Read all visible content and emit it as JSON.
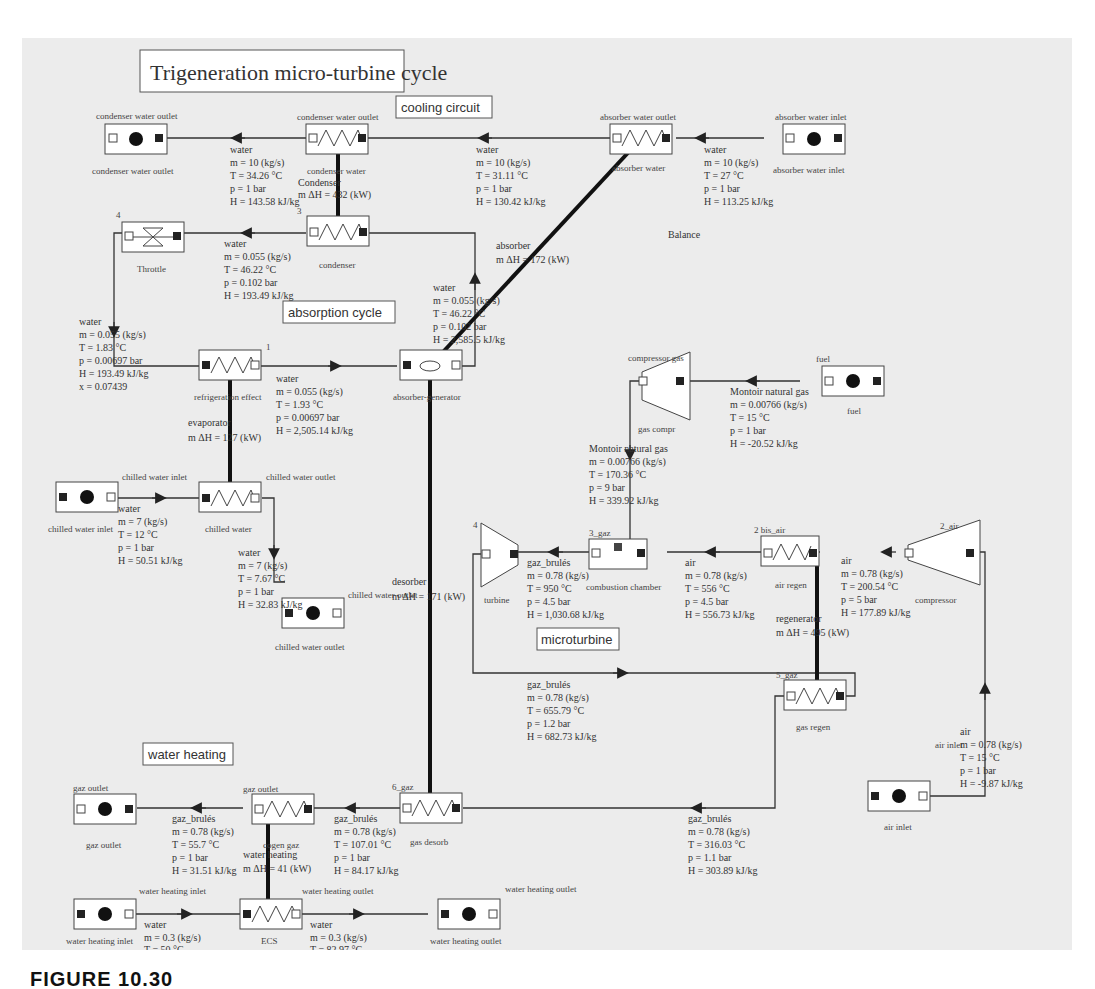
{
  "title": "Trigeneration micro-turbine cycle",
  "sections": {
    "cooling": "cooling circuit",
    "absorption": "absorption cycle",
    "microturbine": "microturbine",
    "water_heating": "water heating",
    "balance": "Balance"
  },
  "caption": "FIGURE 10.30",
  "components": {
    "cond_out_src": {
      "top": "condenser water outlet",
      "bottom": "condenser water outlet"
    },
    "cond_water_hx": {
      "top": "condenser water outlet",
      "bottom": "condenser water"
    },
    "abs_water_hx": {
      "top": "absorber water outlet",
      "bottom": "absorber water"
    },
    "abs_in_src": {
      "top": "absorber water inlet",
      "bottom": "absorber water inlet"
    },
    "throttle": {
      "num": "4",
      "bottom": "Throttle"
    },
    "condenser": {
      "num": "3",
      "bottom": "condenser"
    },
    "refrig": {
      "num": "1",
      "bottom": "refrigeration effect"
    },
    "absgen": {
      "bottom": "absorber-generator"
    },
    "chilled_in_src": {
      "bottom": "chilled water inlet"
    },
    "chilled_hx": {
      "top_left": "chilled water inlet",
      "top_right": "chilled water outlet",
      "bottom": "chilled water"
    },
    "chilled_out_sink": {
      "top": "chilled water outlet",
      "bottom": "chilled water outlet"
    },
    "gas_compr": {
      "top": "compressor gas",
      "bottom": "gas compr"
    },
    "fuel": {
      "top": "fuel",
      "bottom": "fuel"
    },
    "turbine": {
      "num": "4",
      "bottom": "turbine"
    },
    "comb": {
      "top": "3_gaz",
      "bottom": "combustion chamber"
    },
    "air_regen": {
      "top": "2 bis_air",
      "bottom": "air regen"
    },
    "compressor": {
      "top": "2_air",
      "bottom": "compressor"
    },
    "gas_regen": {
      "top": "5_gaz",
      "bottom": "gas regen"
    },
    "air_inlet": {
      "top": "air inlet",
      "bottom": "air inlet"
    },
    "gas_outlet": {
      "top": "gaz outlet",
      "bottom": "gaz outlet"
    },
    "cogen": {
      "top": "gaz outlet",
      "bottom": "cogen gaz"
    },
    "gas_desorb": {
      "top": "6_gaz",
      "bottom": "gas desorb"
    },
    "wh_in": {
      "top": "water heating inlet",
      "bottom": "water heating inlet"
    },
    "ecs": {
      "top": "water heating outlet",
      "bottom": "ECS"
    },
    "wh_out": {
      "top": "water heating outlet",
      "bottom": "water heating outlet"
    }
  },
  "exchangers": {
    "condenser": {
      "name": "Condenser",
      "duty": "m ΔH = 432 (kW)"
    },
    "absorber": {
      "name": "absorber",
      "duty": "m ΔH = 172 (kW)"
    },
    "evaporator": {
      "name": "evaporator",
      "duty": "m ΔH = 127 (kW)"
    },
    "desorber": {
      "name": "desorber",
      "duty": "m ΔH = 171 (kW)"
    },
    "regenerator": {
      "name": "regenerator",
      "duty": "m ΔH = 495 (kW)"
    },
    "water_heating": {
      "name": "water heating",
      "duty": "m ΔH = 41 (kW)"
    }
  },
  "streams": {
    "s_cond_water": {
      "fluid": "water",
      "m": "m = 10 (kg/s)",
      "T": "T = 34.26 °C",
      "p": "p = 1 bar",
      "H": "H = 143.58 kJ/kg"
    },
    "s_abs_water": {
      "fluid": "water",
      "m": "m = 10 (kg/s)",
      "T": "T = 31.11 °C",
      "p": "p = 1 bar",
      "H": "H = 130.42 kJ/kg"
    },
    "s_abs_in": {
      "fluid": "water",
      "m": "m = 10 (kg/s)",
      "T": "T = 27 °C",
      "p": "p = 1 bar",
      "H": "H = 113.25 kJ/kg"
    },
    "s_cond_out": {
      "fluid": "water",
      "m": "m = 0.055 (kg/s)",
      "T": "T = 46.22 °C",
      "p": "p = 0.102 bar",
      "H": "H = 193.49 kJ/kg"
    },
    "s_gen_out": {
      "fluid": "water",
      "m": "m = 0.055 (kg/s)",
      "T": "T = 46.22 °C",
      "p": "p = 0.102 bar",
      "H": "H = 2,585.5 kJ/kg"
    },
    "s_throttle_out": {
      "fluid": "water",
      "m": "m = 0.055 (kg/s)",
      "T": "T = 1.83 °C",
      "p": "p = 0.00697 bar",
      "H": "H = 193.49 kJ/kg",
      "x": "x = 0.07439"
    },
    "s_evap_out": {
      "fluid": "water",
      "m": "m = 0.055 (kg/s)",
      "T": "T = 1.93 °C",
      "p": "p = 0.00697 bar",
      "H": "H = 2,505.14 kJ/kg"
    },
    "s_chilled_in": {
      "fluid": "water",
      "m": "m = 7 (kg/s)",
      "T": "T = 12 °C",
      "p": "p = 1 bar",
      "H": "H = 50.51 kJ/kg"
    },
    "s_chilled_out": {
      "fluid": "water",
      "m": "m = 7 (kg/s)",
      "T": "T = 7.67 °C",
      "p": "p = 1 bar",
      "H": "H = 32.83 kJ/kg"
    },
    "s_fuel": {
      "fluid": "Montoir natural gas",
      "m": "m = 0.00766 (kg/s)",
      "T": "T = 15 °C",
      "p": "p = 1 bar",
      "H": "H = -20.52 kJ/kg"
    },
    "s_fuel_comp": {
      "fluid": "Montoir natural gas",
      "m": "m = 0.00766 (kg/s)",
      "T": "T = 170.36 °C",
      "p": "p = 9 bar",
      "H": "H = 339.92 kJ/kg"
    },
    "s_comb_out": {
      "fluid": "gaz_brulés",
      "m": "m = 0.78 (kg/s)",
      "T": "T = 950 °C",
      "p": "p = 4.5 bar",
      "H": "H = 1,030.68 kJ/kg"
    },
    "s_air_regen": {
      "fluid": "air",
      "m": "m = 0.78 (kg/s)",
      "T": "T = 556 °C",
      "p": "p = 4.5 bar",
      "H": "H = 556.73 kJ/kg"
    },
    "s_air_comp": {
      "fluid": "air",
      "m": "m = 0.78 (kg/s)",
      "T": "T = 200.54 °C",
      "p": "p = 5 bar",
      "H": "H = 177.89 kJ/kg"
    },
    "s_turb_out": {
      "fluid": "gaz_brulés",
      "m": "m = 0.78 (kg/s)",
      "T": "T = 655.79 °C",
      "p": "p = 1.2 bar",
      "H": "H = 682.73 kJ/kg"
    },
    "s_air_in": {
      "fluid": "air",
      "m": "m = 0.78 (kg/s)",
      "T": "T = 15 °C",
      "p": "p = 1 bar",
      "H": "H = -9.87 kJ/kg"
    },
    "s_regen_out": {
      "fluid": "gaz_brulés",
      "m": "m = 0.78 (kg/s)",
      "T": "T = 316.03 °C",
      "p": "p = 1.1 bar",
      "H": "H = 303.89 kJ/kg"
    },
    "s_desorb_out": {
      "fluid": "gaz_brulés",
      "m": "m = 0.78 (kg/s)",
      "T": "T = 107.01 °C",
      "p": "p = 1 bar",
      "H": "H = 84.17 kJ/kg"
    },
    "s_gas_out": {
      "fluid": "gaz_brulés",
      "m": "m = 0.78 (kg/s)",
      "T": "T = 55.7 °C",
      "p": "p = 1 bar",
      "H": "H = 31.51 kJ/kg"
    },
    "s_wh_in": {
      "fluid": "water",
      "m": "m = 0.3 (kg/s)",
      "T": "T = 50 °C"
    },
    "s_wh_out": {
      "fluid": "water",
      "m": "m = 0.3 (kg/s)",
      "T": "T = 82.97 °C"
    }
  },
  "colors": {
    "background": "#ececec",
    "line": "#333333",
    "heat_link": "#111111",
    "port_filled": "#222222"
  }
}
